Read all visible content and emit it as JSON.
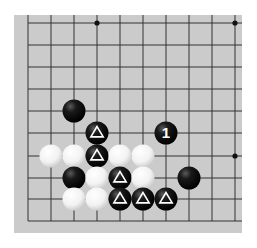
{
  "board": {
    "background": "#cbcbcb",
    "line_color": "#333333",
    "cols_x": [
      28,
      51,
      74,
      97,
      120,
      143,
      166,
      189,
      212,
      235
    ],
    "rows_y": [
      23,
      45,
      67,
      89,
      111,
      133,
      156,
      178,
      199,
      221
    ],
    "line_extent": {
      "x_min": 28,
      "x_max": 242,
      "y_min": 15,
      "y_max": 221
    },
    "star_points": [
      {
        "col": 3,
        "row": 0
      },
      {
        "col": 9,
        "row": 0
      },
      {
        "col": 9,
        "row": 6
      }
    ]
  },
  "stones": [
    {
      "color": "black",
      "col": 2,
      "row": 4,
      "marker": ""
    },
    {
      "color": "black",
      "col": 3,
      "row": 5,
      "marker": "triangle"
    },
    {
      "color": "black",
      "col": 6,
      "row": 5,
      "marker": "1"
    },
    {
      "color": "white",
      "col": 1,
      "row": 6,
      "marker": ""
    },
    {
      "color": "white",
      "col": 2,
      "row": 6,
      "marker": ""
    },
    {
      "color": "black",
      "col": 3,
      "row": 6,
      "marker": "triangle"
    },
    {
      "color": "white",
      "col": 4,
      "row": 6,
      "marker": ""
    },
    {
      "color": "white",
      "col": 5,
      "row": 6,
      "marker": ""
    },
    {
      "color": "black",
      "col": 2,
      "row": 7,
      "marker": ""
    },
    {
      "color": "white",
      "col": 3,
      "row": 7,
      "marker": ""
    },
    {
      "color": "black",
      "col": 4,
      "row": 7,
      "marker": "triangle"
    },
    {
      "color": "white",
      "col": 5,
      "row": 7,
      "marker": ""
    },
    {
      "color": "black",
      "col": 7,
      "row": 7,
      "marker": ""
    },
    {
      "color": "white",
      "col": 2,
      "row": 8,
      "marker": ""
    },
    {
      "color": "white",
      "col": 3,
      "row": 8,
      "marker": ""
    },
    {
      "color": "black",
      "col": 4,
      "row": 8,
      "marker": "triangle"
    },
    {
      "color": "black",
      "col": 5,
      "row": 8,
      "marker": "triangle"
    },
    {
      "color": "black",
      "col": 6,
      "row": 8,
      "marker": "triangle"
    }
  ],
  "move_label": "1"
}
